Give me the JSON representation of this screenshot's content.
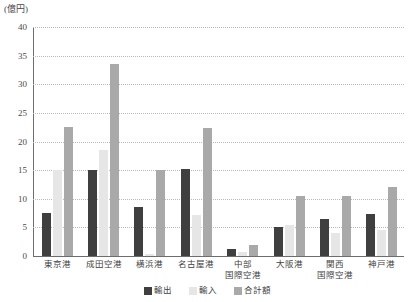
{
  "unit_label": "(億円)",
  "colors": {
    "export": "#3f3f3f",
    "import": "#e6e6e6",
    "total": "#a9a9a9",
    "axis": "#6d6d6d",
    "grid": "#b9b9c4",
    "text": "#3f3f3f",
    "background": "#ffffff"
  },
  "legend": {
    "position": "bottom-center",
    "items": [
      {
        "label": "輸出",
        "series": "export"
      },
      {
        "label": "輸入",
        "series": "import"
      },
      {
        "label": "合計額",
        "series": "total"
      }
    ]
  },
  "y_axis": {
    "ticks": [
      "0",
      "5",
      "10",
      "15",
      "20",
      "25",
      "30",
      "35",
      "40"
    ],
    "min": 0,
    "max": 40,
    "step": 5,
    "grid": true
  },
  "x_axis": {
    "labels": [
      {
        "lines": [
          "東京港"
        ]
      },
      {
        "lines": [
          "成田空港"
        ]
      },
      {
        "lines": [
          "横浜港"
        ]
      },
      {
        "lines": [
          "名古屋港"
        ]
      },
      {
        "lines": [
          "中部",
          "国際空港"
        ]
      },
      {
        "lines": [
          "大阪港"
        ]
      },
      {
        "lines": [
          "関西",
          "国際空港"
        ]
      },
      {
        "lines": [
          "神戸港"
        ]
      }
    ]
  },
  "chart_data": {
    "type": "bar",
    "title": "",
    "xlabel": "",
    "ylabel": "(億円)",
    "ylim": [
      0,
      40
    ],
    "ytick_step": 5,
    "grid": true,
    "legend_position": "bottom-center",
    "categories": [
      "東京港",
      "成田空港",
      "横浜港",
      "名古屋港",
      "中部国際空港",
      "大阪港",
      "関西国際空港",
      "神戸港"
    ],
    "series": [
      {
        "name": "輸出",
        "color": "#3f3f3f",
        "values": [
          7.5,
          15.0,
          8.5,
          15.2,
          1.3,
          5.0,
          6.5,
          7.4
        ]
      },
      {
        "name": "輸入",
        "color": "#e6e6e6",
        "values": [
          15.0,
          18.5,
          0.3,
          7.2,
          0.7,
          5.5,
          4.0,
          4.6
        ]
      },
      {
        "name": "合計額",
        "color": "#a9a9a9",
        "values": [
          22.6,
          33.5,
          15.0,
          22.4,
          2.0,
          10.5,
          10.5,
          12.0
        ]
      }
    ]
  }
}
